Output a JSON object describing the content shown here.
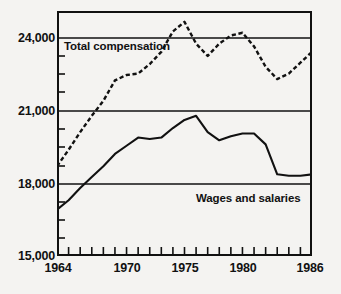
{
  "chart_data": {
    "type": "line",
    "title": "",
    "subtitle": "",
    "xlabel": "",
    "ylabel": "",
    "xlim": [
      1964,
      1986
    ],
    "ylim": [
      15000,
      24000
    ],
    "grid": true,
    "gridlines_y": [
      24000,
      21000,
      18000,
      15000
    ],
    "legend_position": "inline-annotations",
    "y_ticks": [
      "24,000",
      "21,000",
      "18,000",
      "15,000"
    ],
    "y_tick_values": [
      24000,
      21000,
      18000,
      15000
    ],
    "y_minor_ticks": [
      15750,
      16500,
      17250,
      18750,
      19500,
      20250,
      21750,
      22500,
      23250
    ],
    "x_ticks_labeled": [
      "1964",
      "1970",
      "1975",
      "1980",
      "1986"
    ],
    "x_tick_values_labeled": [
      1964,
      1970,
      1975,
      1980,
      1986
    ],
    "x_minor_ticks": [
      1965,
      1966,
      1967,
      1968,
      1969,
      1971,
      1972,
      1973,
      1974,
      1976,
      1977,
      1978,
      1979,
      1981,
      1982,
      1983,
      1984,
      1985
    ],
    "x": [
      1964,
      1965,
      1966,
      1967,
      1968,
      1969,
      1970,
      1971,
      1972,
      1973,
      1974,
      1975,
      1976,
      1977,
      1978,
      1979,
      1980,
      1981,
      1982,
      1983,
      1984,
      1985,
      1986
    ],
    "series": [
      {
        "name": "Total compensation",
        "style": "dashed",
        "color": "#111111",
        "values": [
          18300,
          18900,
          19550,
          20150,
          20700,
          21450,
          21650,
          21700,
          22050,
          22500,
          23250,
          23600,
          22800,
          22350,
          22800,
          23100,
          23200,
          22700,
          21950,
          21500,
          21700,
          22100,
          22500
        ]
      },
      {
        "name": "Wages and salaries",
        "style": "solid",
        "color": "#111111",
        "values": [
          16700,
          17050,
          17500,
          17900,
          18300,
          18750,
          19050,
          19350,
          19300,
          19350,
          19700,
          20000,
          20150,
          19550,
          19250,
          19400,
          19500,
          19500,
          19100,
          18000,
          17950,
          17950,
          18000
        ]
      }
    ],
    "annotations": [
      {
        "id": "total-compensation",
        "text": "Total compensation"
      },
      {
        "id": "wages-and-salaries",
        "text": "Wages and salaries"
      }
    ]
  },
  "axis": {
    "y_labels": [
      "24,000",
      "21,000",
      "18,000",
      "15,000"
    ],
    "x_labels": [
      "1964",
      "1970",
      "1975",
      "1980",
      "1986"
    ]
  },
  "labels": {
    "total_compensation": "Total compensation",
    "wages_and_salaries": "Wages and salaries"
  },
  "colors": {
    "line": "#111111",
    "frame": "#111111",
    "background": "#f4f3f1"
  }
}
